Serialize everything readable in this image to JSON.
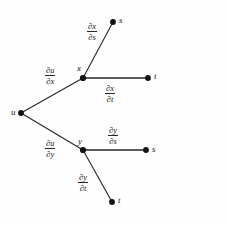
{
  "diagram": {
    "background_color": "#fefefe",
    "line_color": "#262626",
    "node_color": "#111111",
    "text_color": "#1a1a1a",
    "nodes": [
      {
        "id": "u",
        "label": "u",
        "x": 21,
        "y": 113,
        "label_x": 11,
        "label_y": 108
      },
      {
        "id": "x",
        "label": "x",
        "x": 83,
        "y": 78,
        "label_x": 77,
        "label_y": 64
      },
      {
        "id": "y",
        "label": "y",
        "x": 83,
        "y": 150,
        "label_x": 78,
        "label_y": 137
      },
      {
        "id": "s1",
        "label": "s",
        "x": 113,
        "y": 22,
        "label_x": 119,
        "label_y": 16
      },
      {
        "id": "t1",
        "label": "t",
        "x": 148,
        "y": 78,
        "label_x": 154,
        "label_y": 72
      },
      {
        "id": "s2",
        "label": "s",
        "x": 146,
        "y": 150,
        "label_x": 152,
        "label_y": 145
      },
      {
        "id": "t2",
        "label": "t",
        "x": 112,
        "y": 202,
        "label_x": 118,
        "label_y": 196
      }
    ],
    "edges": [
      {
        "id": "u-x",
        "from": "u",
        "to": "x",
        "numerator": "∂u",
        "denominator": "∂x",
        "label_x": 45,
        "label_y": 66
      },
      {
        "id": "u-y",
        "from": "u",
        "to": "y",
        "numerator": "∂u",
        "denominator": "∂y",
        "label_x": 45,
        "label_y": 139
      },
      {
        "id": "x-s",
        "from": "x",
        "to": "s1",
        "numerator": "∂x",
        "denominator": "∂s",
        "label_x": 87,
        "label_y": 22
      },
      {
        "id": "x-t",
        "from": "x",
        "to": "t1",
        "numerator": "∂x",
        "denominator": "∂t",
        "label_x": 105,
        "label_y": 84
      },
      {
        "id": "y-s",
        "from": "y",
        "to": "s2",
        "numerator": "∂y",
        "denominator": "∂s",
        "label_x": 108,
        "label_y": 126
      },
      {
        "id": "y-t",
        "from": "y",
        "to": "t2",
        "numerator": "∂y",
        "denominator": "∂t",
        "label_x": 78,
        "label_y": 173
      }
    ]
  }
}
